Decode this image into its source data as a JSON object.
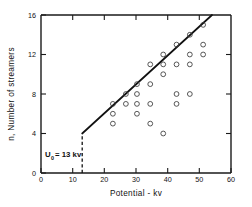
{
  "chart_data": {
    "type": "scatter",
    "title": "",
    "xlabel": "Potential - kv",
    "ylabel": "n, Number of streamers",
    "xlim": [
      0,
      60
    ],
    "ylim": [
      0,
      16
    ],
    "xticks": [
      0,
      10,
      20,
      30,
      40,
      50,
      60
    ],
    "yticks": [
      0,
      4,
      8,
      12,
      16
    ],
    "xtick_labels": [
      "0",
      "10",
      "20",
      "30",
      "40",
      "50",
      "60"
    ],
    "ytick_labels": [
      "0",
      "4",
      "8",
      "12",
      "16"
    ],
    "grid": false,
    "legend": null,
    "marker": "open-circle",
    "points": [
      {
        "x": 22.7,
        "y": 7
      },
      {
        "x": 22.7,
        "y": 6
      },
      {
        "x": 22.7,
        "y": 5
      },
      {
        "x": 26.8,
        "y": 8
      },
      {
        "x": 26.8,
        "y": 7
      },
      {
        "x": 30.3,
        "y": 9
      },
      {
        "x": 30.3,
        "y": 8
      },
      {
        "x": 30.3,
        "y": 7
      },
      {
        "x": 30.3,
        "y": 6
      },
      {
        "x": 34.5,
        "y": 11
      },
      {
        "x": 34.5,
        "y": 9
      },
      {
        "x": 34.5,
        "y": 7
      },
      {
        "x": 34.5,
        "y": 5
      },
      {
        "x": 38.6,
        "y": 12
      },
      {
        "x": 38.6,
        "y": 11
      },
      {
        "x": 38.6,
        "y": 10
      },
      {
        "x": 38.6,
        "y": 4
      },
      {
        "x": 42.8,
        "y": 13
      },
      {
        "x": 42.8,
        "y": 11
      },
      {
        "x": 42.8,
        "y": 8
      },
      {
        "x": 42.8,
        "y": 7
      },
      {
        "x": 47.0,
        "y": 14
      },
      {
        "x": 47.0,
        "y": 12
      },
      {
        "x": 47.0,
        "y": 11
      },
      {
        "x": 47.0,
        "y": 8
      },
      {
        "x": 51.2,
        "y": 15
      },
      {
        "x": 51.2,
        "y": 13
      },
      {
        "x": 51.2,
        "y": 12
      }
    ],
    "fit_line": {
      "name": "linear fit",
      "x0": 13,
      "y0": 4,
      "x1": 54,
      "y1": 16
    },
    "threshold": {
      "x": 13,
      "y_top": 4,
      "y_bottom": 0,
      "style": "dashed"
    },
    "annotation": {
      "symbol": "U",
      "subscript": "0",
      "equals": "= 13 kv",
      "full_text": "U0 = 13 kv"
    }
  }
}
